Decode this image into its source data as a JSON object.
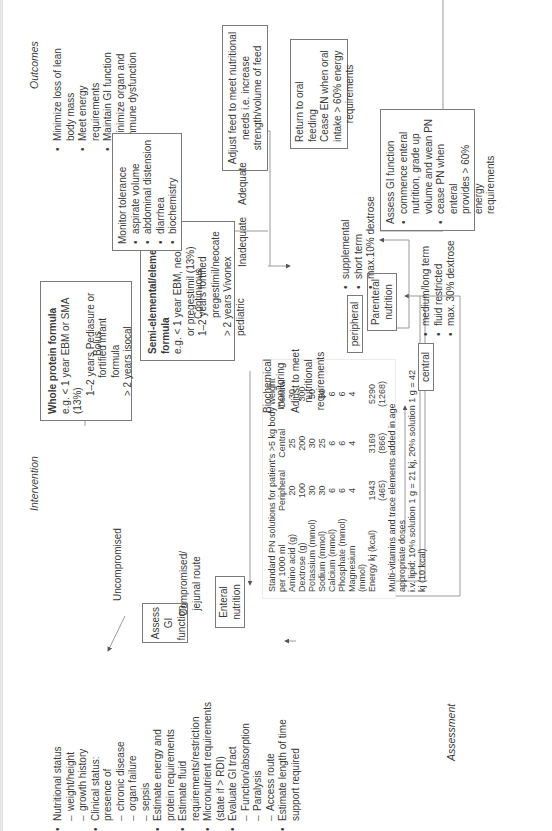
{
  "sections": {
    "assessment": "Assessment",
    "intervention": "Intervention",
    "outcomes": "Outcomes"
  },
  "assessment": {
    "items": [
      {
        "text": "Nutritional status",
        "sub": [
          "weight/height",
          "growth history"
        ]
      },
      {
        "text": "Clinical status:",
        "text2": "presence of",
        "sub": [
          "chronic disease",
          "organ failure",
          "sepsis"
        ]
      },
      {
        "text": "Estimate energy and",
        "text2": "protein requirements",
        "sub": []
      },
      {
        "text": "Estimate fluid",
        "text2": "requirements/restriction",
        "sub": []
      },
      {
        "text": "Micronutrient requirements",
        "text2": "(state if  >  RDI)",
        "sub": []
      },
      {
        "text": "Evaluate GI tract",
        "sub": [
          "Function/absorption",
          "Paralysis",
          "Access route"
        ]
      },
      {
        "text": "Estimate length of time",
        "text2": "support required",
        "sub": []
      }
    ]
  },
  "nodes": {
    "enteral": [
      "Enteral",
      "nutrition"
    ],
    "assess_gi": [
      "Assess GI",
      "function"
    ],
    "parenteral": [
      "Parenteral",
      "nutrition"
    ],
    "whole_protein": {
      "title": "Whole protein formula",
      "lines": [
        "e.g. < 1 year EBM or SMA (13%)",
        "1–2 years Pediasure or",
        "fortified infant formula",
        "> 2 years isocal"
      ]
    },
    "semi_elemental": {
      "title": "Semi-elemental/elemental",
      "title2": "formula",
      "lines": [
        "e.g. < 1 year EBM, neocate",
        "or pregestimil (13%)",
        "1–2 years fortified",
        "pregestimil/neocate",
        "> 2 years Vivonex pediatric"
      ]
    },
    "monitor": {
      "title": "Monitor tolerance",
      "items": [
        "aspirate volume",
        "abdominal distension",
        "diarrhea",
        "biochemistry"
      ]
    },
    "adjust_feed": [
      "Adjust feed to meet nutritional",
      "needs i.e. increase",
      "strength/volume of feed"
    ],
    "return_oral": [
      "Return to oral feeding",
      "Cease EN when oral",
      "intake > 60% energy",
      "requirements"
    ],
    "assess_gi_pn": {
      "title": "Assess GI function",
      "items": [
        [
          "commence enteral",
          "nutrition, grade up",
          "volume and wean PN"
        ],
        [
          "cease PN when enteral",
          "provides > 60% energy",
          "requirements"
        ]
      ]
    },
    "peripheral": "peripheral",
    "central": "central",
    "peripheral_items": [
      "supplemental",
      "short term",
      "max.10% dextrose"
    ],
    "central_items": [
      "medium/long term",
      "fluid restricted",
      "max. 30% dextrose"
    ]
  },
  "edge_labels": {
    "uncompromised": "Uncompromised",
    "compromised": [
      "Compromised/",
      "jejunal route"
    ],
    "bolus": "Bolus",
    "continuous": "Continuous",
    "inadequate": "Inadequate",
    "adequate": "Adequate",
    "biochemical": [
      "Biochemical",
      "monitoring"
    ],
    "adjust_req": [
      "Adjust to meet",
      "nutritional",
      "requirements"
    ]
  },
  "pn_table": {
    "title": "Standard PN solutions for patient's >5 kg body weight",
    "header": [
      "per 1000 ml",
      "Peripheral",
      "Central",
      "Central"
    ],
    "rows": [
      [
        "Amino acid (g)",
        "20",
        "25",
        "30"
      ],
      [
        "Dextrose (g)",
        "100",
        "200",
        "300"
      ],
      [
        "Potassium (mmol)",
        "30",
        "30",
        "50"
      ],
      [
        "Sodium (mmol)",
        "30",
        "25",
        "50"
      ],
      [
        "Calcium (mmol)",
        "6",
        "6",
        "6"
      ],
      [
        "Phosphate (mmol)",
        "6",
        "6",
        "6"
      ],
      [
        "Magnesium (mmol)",
        "4",
        "4",
        "4"
      ],
      [
        "Energy kj (kcal)",
        "1943 (465)",
        "3169 (866)",
        "5290 (1268)"
      ]
    ],
    "note1": "Multi-vitamins and trace elements added in age appropriate doses",
    "note2": "i.v. lipid: 10% solution 1 g = 21 kj, 20% solution 1 g = 42 kj (10 kcal)"
  },
  "outcomes": {
    "items": [
      [
        "Minimize loss of lean",
        "body mass"
      ],
      [
        "Meet energy",
        "requirements"
      ],
      [
        "Maintain GI function"
      ],
      [
        "Minimize organ and",
        "immune dysfunction"
      ]
    ]
  }
}
